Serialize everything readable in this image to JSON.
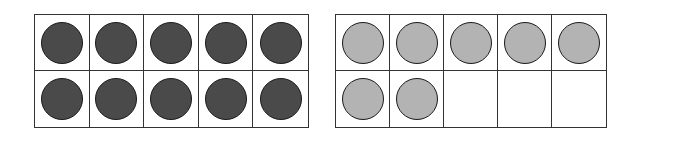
{
  "colors": {
    "frame_border": "#333333",
    "counter_border": "#1a1a1a",
    "dark_counter": "#4a4a4a",
    "light_counter": "#b3b3b3",
    "background": "#ffffff"
  },
  "ten_frames": [
    {
      "name": "left-ten-frame",
      "rows": 2,
      "columns": 5,
      "filled_count": 10,
      "counter_color": "dark",
      "cells": [
        {
          "filled": true,
          "color": "dark"
        },
        {
          "filled": true,
          "color": "dark"
        },
        {
          "filled": true,
          "color": "dark"
        },
        {
          "filled": true,
          "color": "dark"
        },
        {
          "filled": true,
          "color": "dark"
        },
        {
          "filled": true,
          "color": "dark"
        },
        {
          "filled": true,
          "color": "dark"
        },
        {
          "filled": true,
          "color": "dark"
        },
        {
          "filled": true,
          "color": "dark"
        },
        {
          "filled": true,
          "color": "dark"
        }
      ]
    },
    {
      "name": "right-ten-frame",
      "rows": 2,
      "columns": 5,
      "filled_count": 7,
      "counter_color": "light",
      "cells": [
        {
          "filled": true,
          "color": "light"
        },
        {
          "filled": true,
          "color": "light"
        },
        {
          "filled": true,
          "color": "light"
        },
        {
          "filled": true,
          "color": "light"
        },
        {
          "filled": true,
          "color": "light"
        },
        {
          "filled": true,
          "color": "light"
        },
        {
          "filled": true,
          "color": "light"
        },
        {
          "filled": false,
          "color": null
        },
        {
          "filled": false,
          "color": null
        },
        {
          "filled": false,
          "color": null
        }
      ]
    }
  ],
  "total_counters": 17
}
